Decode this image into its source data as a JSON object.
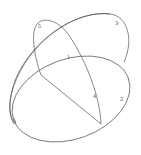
{
  "figure": {
    "stroke_color": "#555555",
    "labels": [
      {
        "id": "label-5",
        "text": "5",
        "x": 38,
        "y": 24
      },
      {
        "id": "label-3",
        "text": "3",
        "x": 115,
        "y": 21
      },
      {
        "id": "label-1",
        "text": "1",
        "x": 67,
        "y": 55
      },
      {
        "id": "label-4",
        "text": "4",
        "x": 93,
        "y": 94
      },
      {
        "id": "label-2",
        "text": "2",
        "x": 120,
        "y": 97
      }
    ]
  }
}
